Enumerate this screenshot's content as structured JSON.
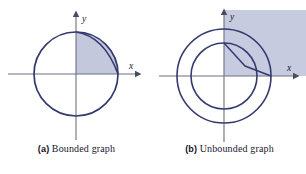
{
  "figure": {
    "type": "math-figure-pair",
    "background_color": "#ffffff"
  },
  "colors": {
    "curve_stroke": "#343a6e",
    "axis_stroke": "#6e6e84",
    "shade_fill": "#c3c8dd",
    "shade_fill_b": "#c6cbdf",
    "caption_text": "#181830",
    "tag_text": "#10102a"
  },
  "panels": [
    {
      "id": "a",
      "tag": "(a)",
      "caption": "Bounded graph",
      "axis_labels": {
        "x": "x",
        "y": "y"
      },
      "shape": "single-circle",
      "shaded_region": "quadrant-I sector inside circle bounded below by x-axis, left by y-axis, and by two near-tangent arcs at upper right",
      "circle": {
        "cx": 76,
        "cy": 74,
        "r": 42
      },
      "inner_arc": {
        "from": [
          76,
          32
        ],
        "to": [
          118,
          74
        ]
      },
      "axes": {
        "x": {
          "x1": 8,
          "y1": 74,
          "x2": 140,
          "y2": 74
        },
        "y": {
          "x1": 76,
          "y1": 140,
          "x2": 76,
          "y2": 12
        }
      }
    },
    {
      "id": "b",
      "tag": "(b)",
      "caption": "Unbounded graph",
      "axis_labels": {
        "x": "x",
        "y": "y"
      },
      "shape": "two-concentric-circles",
      "shaded_region": "first-quadrant rectangular region extending to the upper right edge of the frame",
      "outer_circle": {
        "cx": 71,
        "cy": 76,
        "r": 47
      },
      "inner_circle": {
        "cx": 71,
        "cy": 76,
        "r": 33
      },
      "wedge": {
        "vertex": [
          71,
          43
        ],
        "corner": [
          92,
          66
        ],
        "end": [
          118,
          76
        ]
      },
      "shade_rect": {
        "x": 71,
        "y": 12,
        "w": 82,
        "h": 64
      },
      "axes": {
        "x": {
          "x1": 6,
          "y1": 76,
          "x2": 145,
          "y2": 76
        },
        "y": {
          "x1": 71,
          "y1": 142,
          "x2": 71,
          "y2": 12
        }
      }
    }
  ]
}
